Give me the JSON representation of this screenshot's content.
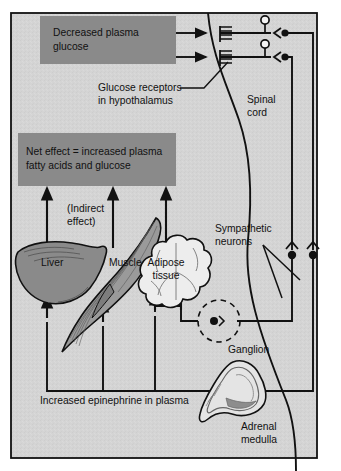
{
  "figure": {
    "background_color": "#d3d3d3",
    "box_fill_color": "#8a8a8a",
    "line_color": "#111111",
    "frame_color": "#111111",
    "organ_dark_fill": "#8a8a8a",
    "organ_light_fill": "#ededed"
  },
  "boxes": {
    "stimulus": {
      "line1": "Decreased plasma",
      "line2": "glucose"
    },
    "net_effect": {
      "line1": "Net effect = increased plasma",
      "line2": "fatty acids and glucose"
    }
  },
  "labels": {
    "glucose_receptors_line1": "Glucose receptors",
    "glucose_receptors_line2": "in hypothalamus",
    "spinal_cord_line1": "Spinal",
    "spinal_cord_line2": "cord",
    "sympathetic_line1": "Sympathetic",
    "sympathetic_line2": "neurons",
    "ganglion": "Ganglion",
    "adrenal_line1": "Adrenal",
    "adrenal_line2": "medulla",
    "indirect_line1": "(Indirect",
    "indirect_line2": "effect)",
    "epinephrine": "Increased epinephrine in plasma"
  },
  "organs": [
    {
      "name": "liver",
      "label": "Liver",
      "fill": "#8a8a8a"
    },
    {
      "name": "muscle",
      "label": "Muscle",
      "fill": "#9a9a9a"
    },
    {
      "name": "adipose",
      "label_line1": "Adipose",
      "label_line2": "tissue",
      "fill": "#ededed"
    },
    {
      "name": "adrenal-medulla",
      "label_line1": "Adrenal",
      "label_line2": "medulla",
      "fill": "#e4e4e4"
    }
  ],
  "circuit": {
    "receptor_count": 2,
    "receptor_name": "glucose-receptor-comb",
    "afferent_arrow_count": 2,
    "spinal_neuron_count": 2,
    "sympathetic_synapse_count": 2,
    "ganglion_count": 1,
    "effect_arrow_count": 3,
    "epinephrine_arrow_count": 3
  }
}
